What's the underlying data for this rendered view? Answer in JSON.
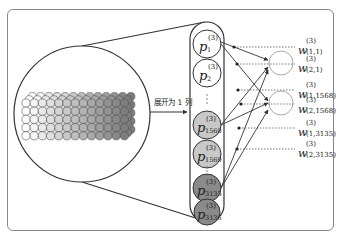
{
  "diagram": {
    "unfold_label": "展开为 1 列",
    "layer_superscript": "(3)",
    "nodes": [
      {
        "symbol": "p",
        "sub": "1",
        "sup": "(3)",
        "fill": "#ffffff"
      },
      {
        "symbol": "p",
        "sub": "2",
        "sup": "(3)",
        "fill": "#ffffff"
      },
      {
        "symbol": "p",
        "sub": "1568",
        "sup": "(3)",
        "fill": "#c8c8c8"
      },
      {
        "symbol": "p",
        "sub": "1569",
        "sup": "(3)",
        "fill": "#c8c8c8"
      },
      {
        "symbol": "p",
        "sub": "3135",
        "sup": "(3)",
        "fill": "#8a8a8a"
      },
      {
        "symbol": "p",
        "sub": "3136",
        "sup": "(3)",
        "fill": "#8a8a8a"
      }
    ],
    "ellipsis": "⋮",
    "weights": [
      {
        "symbol": "w",
        "sup": "(3)",
        "sub": "(1,1)"
      },
      {
        "symbol": "w",
        "sup": "(3)",
        "sub": "(2,1)"
      },
      {
        "symbol": "w",
        "sup": "(3)",
        "sub": "(1,1568)"
      },
      {
        "symbol": "w",
        "sup": "(3)",
        "sub": "(2,1568)"
      },
      {
        "symbol": "w",
        "sup": "(3)",
        "sub": "(1,3135)"
      },
      {
        "symbol": "w",
        "sup": "(3)",
        "sub": "(2,3135)"
      }
    ],
    "output_neurons": 2,
    "colors": {
      "stroke": "#333333",
      "neuron_outline": "#aaaaaa",
      "frame": "#888888"
    }
  }
}
